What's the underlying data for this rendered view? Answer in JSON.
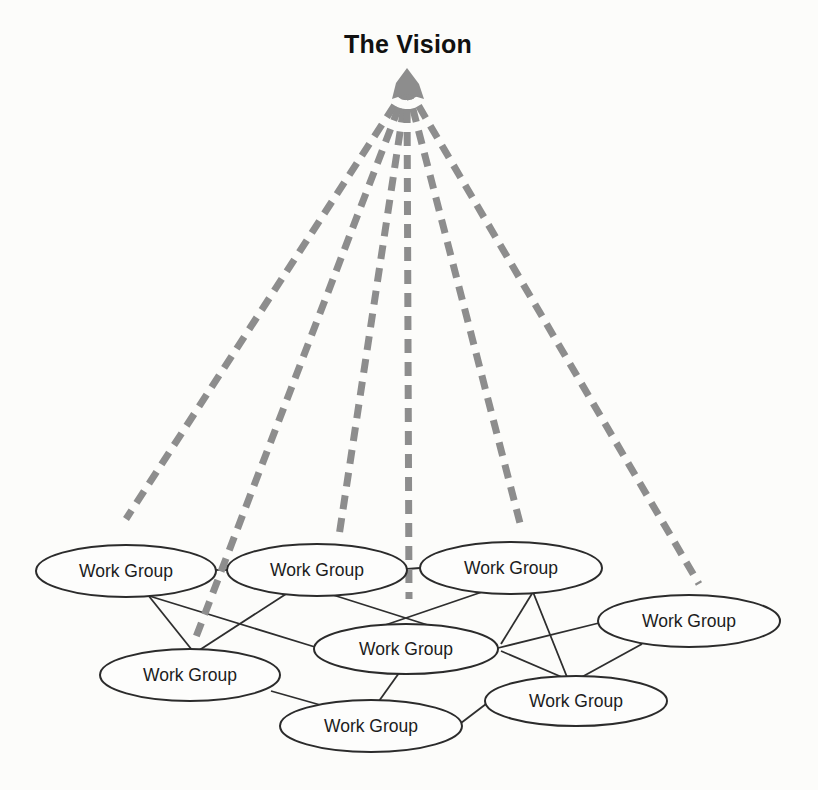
{
  "title": "The Vision",
  "colors": {
    "background": "#fcfcfa",
    "ray": "#8d8d8d",
    "edge": "#2e2e2e",
    "node_stroke": "#2b2b2b",
    "node_fill": "#fdfdfc",
    "title_color": "#111111"
  },
  "diagram": {
    "apex": {
      "x": 407,
      "y": 86,
      "blob": "407,68 419,84 424,99 407,94 392,99 396,83"
    },
    "rays": [
      {
        "x2": 126,
        "y2": 519
      },
      {
        "x2": 196,
        "y2": 637
      },
      {
        "x2": 339,
        "y2": 536
      },
      {
        "x2": 409,
        "y2": 599
      },
      {
        "x2": 521,
        "y2": 527
      },
      {
        "x2": 699,
        "y2": 584
      }
    ],
    "nodes": [
      {
        "id": "wg-1",
        "label": "Work Group",
        "cx": 126,
        "cy": 571,
        "rx": 90,
        "ry": 26
      },
      {
        "id": "wg-2",
        "label": "Work Group",
        "cx": 317,
        "cy": 570,
        "rx": 90,
        "ry": 26
      },
      {
        "id": "wg-3",
        "label": "Work Group",
        "cx": 511,
        "cy": 568,
        "rx": 91,
        "ry": 26
      },
      {
        "id": "wg-4",
        "label": "Work Group",
        "cx": 689,
        "cy": 621,
        "rx": 91,
        "ry": 26
      },
      {
        "id": "wg-5",
        "label": "Work Group",
        "cx": 406,
        "cy": 649,
        "rx": 92,
        "ry": 25
      },
      {
        "id": "wg-6",
        "label": "Work Group",
        "cx": 190,
        "cy": 675,
        "rx": 90,
        "ry": 26
      },
      {
        "id": "wg-7",
        "label": "Work Group",
        "cx": 576,
        "cy": 701,
        "rx": 91,
        "ry": 25
      },
      {
        "id": "wg-8",
        "label": "Work Group",
        "cx": 371,
        "cy": 726,
        "rx": 91,
        "ry": 26
      }
    ],
    "edges": [
      [
        216,
        570,
        227,
        570
      ],
      [
        407,
        569,
        420,
        568
      ],
      [
        148,
        595,
        192,
        650
      ],
      [
        286,
        594,
        198,
        651
      ],
      [
        146,
        595,
        315,
        647
      ],
      [
        482,
        592,
        318,
        648
      ],
      [
        330,
        594,
        497,
        647
      ],
      [
        533,
        592,
        567,
        677
      ],
      [
        533,
        592,
        501,
        644
      ],
      [
        498,
        648,
        599,
        623
      ],
      [
        642,
        644,
        580,
        678
      ],
      [
        501,
        651,
        564,
        678
      ],
      [
        399,
        673,
        379,
        701
      ],
      [
        271,
        691,
        331,
        708
      ],
      [
        486,
        704,
        461,
        723
      ]
    ]
  }
}
